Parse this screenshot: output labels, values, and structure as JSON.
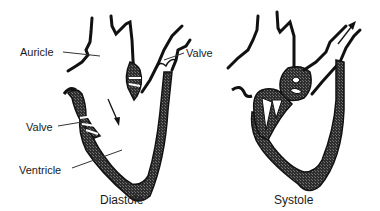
{
  "diagram": {
    "panels": [
      {
        "id": "diastole",
        "caption": "Diastole",
        "labels": {
          "auricle": "Auricle",
          "valve_upper": "Valve",
          "valve_lower": "Valve",
          "ventricle": "Ventricle"
        },
        "flow_arrow": "blood-flow-down-arrow"
      },
      {
        "id": "systole",
        "caption": "Systole",
        "flow_arrow": "blood-flow-out-arrow"
      }
    ],
    "colors": {
      "wall_fill": "#3a3a3a",
      "outline": "#111111",
      "text": "#1a1a1a",
      "background": "#ffffff"
    }
  }
}
